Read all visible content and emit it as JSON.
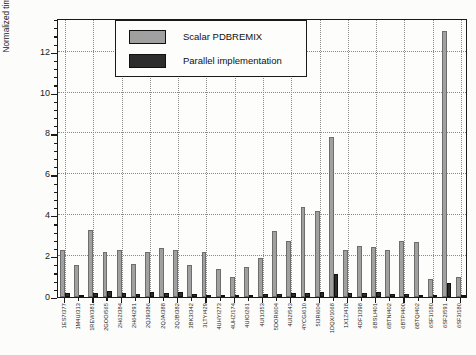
{
  "figure": {
    "background": "#fcfcfa",
    "frame_color": "#1a1a1a",
    "grid_style": "dotted",
    "y_axis_title": "Normalized time to lowest ASA calculation total time (6SF3)",
    "legend": {
      "items": [
        {
          "label": "Scalar PDBREMIX",
          "color": "#a0a0a0"
        },
        {
          "label": "Parallel implementation",
          "color": "#2d2d2d"
        }
      ]
    }
  },
  "chart_data": {
    "type": "bar",
    "title": "",
    "xlabel": "",
    "ylabel": "Normalized time to lowest ASA calculation total time (6SF3)",
    "ylim": [
      0,
      13.65
    ],
    "yticks": [
      0,
      2,
      4,
      6,
      8,
      10,
      12
    ],
    "y_minor_step": 0.4,
    "grid": "dotted horizontal at each major y tick; dotted vertical every 2 categories",
    "legend_position": "upper left",
    "categories": [
      "1ES7/377",
      "1M4U/313",
      "1REW/381",
      "2GOO/565",
      "2H62/384",
      "2H64/291",
      "2QJ9/386",
      "2QJA/388",
      "2QJB/382",
      "3BK3/342",
      "3LTY/429",
      "4UHY/273",
      "4UHZ/174",
      "4UIO/261",
      "4UI1/353",
      "5DOR/604",
      "4UI2/543",
      "4YCG/610",
      "5I3R/604",
      "1DQX/1068",
      "1X1Z/418",
      "4DF1/398",
      "6BSL/401",
      "6BTN/402",
      "6BTP/400",
      "6BTQ/402",
      "6SF1/180",
      "6SF2/591",
      "6SF3/180"
    ],
    "series": [
      {
        "name": "Scalar PDBREMIX",
        "color": "#a0a0a0",
        "values": [
          2.3,
          1.55,
          3.3,
          2.2,
          2.3,
          1.6,
          2.2,
          2.4,
          2.3,
          1.55,
          2.2,
          1.35,
          1.0,
          1.45,
          1.9,
          3.25,
          2.75,
          4.4,
          4.2,
          7.85,
          2.3,
          2.5,
          2.45,
          2.3,
          2.75,
          2.7,
          0.9,
          13.0,
          1.0
        ]
      },
      {
        "name": "Parallel implementation",
        "color": "#2d2d2d",
        "values": [
          0.2,
          0.1,
          0.2,
          0.3,
          0.2,
          0.15,
          0.25,
          0.2,
          0.25,
          0.15,
          0.1,
          0.1,
          0.05,
          0.1,
          0.15,
          0.15,
          0.2,
          0.2,
          0.25,
          1.15,
          0.2,
          0.2,
          0.25,
          0.17,
          0.13,
          0.1,
          0.05,
          0.7,
          0.03
        ]
      }
    ]
  }
}
